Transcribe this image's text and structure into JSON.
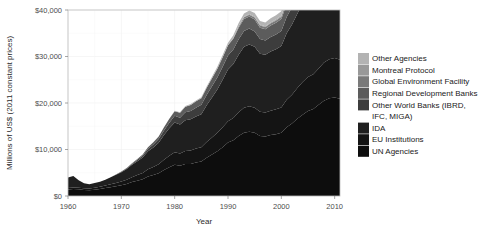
{
  "chart_data": {
    "type": "area",
    "stacked": true,
    "title": "",
    "xlabel": "Year",
    "ylabel": "Millions of US$ (2011 constant prices)",
    "xlim": [
      1960,
      2011
    ],
    "ylim": [
      0,
      40000
    ],
    "xticks": [
      1960,
      1970,
      1980,
      1990,
      2000,
      2010
    ],
    "xtick_labels": [
      "1960",
      "1970",
      "1980",
      "1990",
      "2000",
      "2010"
    ],
    "yticks": [
      0,
      10000,
      20000,
      30000,
      40000
    ],
    "ytick_labels": [
      "$0",
      "$10,000",
      "$20,000",
      "$30,000",
      "$40,000"
    ],
    "grid": true,
    "legend_position": "right",
    "x": [
      1960,
      1961,
      1962,
      1963,
      1964,
      1965,
      1966,
      1967,
      1968,
      1969,
      1970,
      1971,
      1972,
      1973,
      1974,
      1975,
      1976,
      1977,
      1978,
      1979,
      1980,
      1981,
      1982,
      1983,
      1984,
      1985,
      1986,
      1987,
      1988,
      1989,
      1990,
      1991,
      1992,
      1993,
      1994,
      1995,
      1996,
      1997,
      1998,
      1999,
      2000,
      2001,
      2002,
      2003,
      2004,
      2005,
      2006,
      2007,
      2008,
      2009,
      2010,
      2011
    ],
    "series": [
      {
        "name": "UN Agencies",
        "color": "#0d0d0d",
        "values": [
          1400,
          1500,
          1450,
          1300,
          1250,
          1350,
          1500,
          1700,
          1900,
          2100,
          2300,
          2600,
          3000,
          3300,
          3600,
          4200,
          4500,
          4900,
          5600,
          6200,
          6700,
          6500,
          6900,
          6900,
          7200,
          7400,
          8200,
          8900,
          9600,
          10500,
          11500,
          12000,
          12900,
          13600,
          13800,
          13600,
          12900,
          12800,
          13100,
          13300,
          13600,
          14800,
          15600,
          16600,
          17500,
          18300,
          18700,
          19600,
          20500,
          21000,
          21200,
          20900
        ]
      },
      {
        "name": "EU Institutions",
        "color": "#141414",
        "values": [
          300,
          320,
          340,
          360,
          380,
          420,
          480,
          540,
          620,
          700,
          800,
          900,
          1050,
          1200,
          1350,
          1550,
          1750,
          1950,
          2200,
          2450,
          2700,
          2650,
          2800,
          2900,
          3000,
          3100,
          3400,
          3700,
          4000,
          4300,
          4600,
          4800,
          5100,
          5400,
          5500,
          5400,
          5200,
          5150,
          5250,
          5350,
          5450,
          5900,
          6200,
          6600,
          7000,
          7300,
          7500,
          7800,
          8200,
          8400,
          8500,
          8400
        ]
      },
      {
        "name": "IDA",
        "color": "#1f1f1f",
        "values": [
          2300,
          2500,
          1600,
          1100,
          900,
          1000,
          1100,
          1250,
          1500,
          1750,
          2000,
          2300,
          2650,
          3000,
          3350,
          3900,
          4200,
          4600,
          5300,
          5900,
          6400,
          6200,
          6600,
          6700,
          6900,
          7100,
          7900,
          8600,
          9300,
          10200,
          11100,
          11600,
          12400,
          13100,
          13300,
          13100,
          12500,
          12400,
          12700,
          12900,
          13200,
          14300,
          15100,
          16000,
          16900,
          17700,
          18100,
          19000,
          19800,
          20300,
          20500,
          20200
        ]
      },
      {
        "name": "Other World Banks (IBRD, IFC, MIGA)",
        "color": "#3d3d3d",
        "values": [
          0,
          0,
          0,
          0,
          0,
          0,
          0,
          0,
          0,
          50,
          100,
          150,
          200,
          280,
          350,
          500,
          650,
          800,
          1000,
          1200,
          1450,
          1500,
          1700,
          1800,
          1900,
          2000,
          2200,
          2400,
          2600,
          2800,
          3000,
          3100,
          3300,
          3400,
          3400,
          3300,
          3150,
          3100,
          3150,
          3200,
          3250,
          3500,
          3700,
          3900,
          4100,
          4300,
          4400,
          4600,
          4800,
          4900,
          5000,
          4900
        ]
      },
      {
        "name": "Regional Development Banks",
        "color": "#5c5c5c",
        "values": [
          0,
          0,
          0,
          0,
          0,
          0,
          0,
          0,
          0,
          0,
          50,
          80,
          120,
          180,
          250,
          350,
          450,
          560,
          700,
          850,
          1000,
          1050,
          1200,
          1280,
          1350,
          1420,
          1580,
          1720,
          1870,
          2040,
          2220,
          2310,
          2470,
          2590,
          2620,
          2570,
          2440,
          2410,
          2460,
          2500,
          2540,
          2760,
          2910,
          3090,
          3250,
          3400,
          3480,
          3650,
          3810,
          3900,
          3950,
          3880
        ]
      },
      {
        "name": "Global Environment Facility",
        "color": "#7a7a7a",
        "values": [
          0,
          0,
          0,
          0,
          0,
          0,
          0,
          0,
          0,
          0,
          0,
          0,
          0,
          0,
          0,
          0,
          0,
          0,
          0,
          0,
          0,
          0,
          0,
          0,
          0,
          0,
          0,
          0,
          0,
          0,
          0,
          120,
          260,
          330,
          380,
          420,
          460,
          470,
          490,
          500,
          520,
          580,
          620,
          660,
          700,
          740,
          760,
          800,
          840,
          870,
          890,
          870
        ]
      },
      {
        "name": "Montreal Protocol",
        "color": "#999999",
        "values": [
          0,
          0,
          0,
          0,
          0,
          0,
          0,
          0,
          0,
          0,
          0,
          0,
          0,
          0,
          0,
          0,
          0,
          0,
          0,
          0,
          0,
          0,
          0,
          0,
          0,
          0,
          0,
          0,
          0,
          0,
          0,
          40,
          90,
          120,
          140,
          160,
          170,
          175,
          180,
          185,
          190,
          210,
          225,
          240,
          255,
          270,
          280,
          295,
          310,
          320,
          325,
          320
        ]
      },
      {
        "name": "Other Agencies",
        "color": "#b3b3b3",
        "values": [
          0,
          0,
          0,
          0,
          0,
          0,
          0,
          0,
          0,
          0,
          0,
          0,
          0,
          0,
          0,
          0,
          0,
          0,
          0,
          0,
          100,
          120,
          150,
          180,
          210,
          240,
          290,
          340,
          400,
          470,
          540,
          580,
          660,
          720,
          750,
          780,
          800,
          830,
          880,
          930,
          990,
          1150,
          1280,
          1450,
          1650,
          1900,
          2100,
          2400,
          2700,
          2950,
          3100,
          3050
        ]
      }
    ],
    "legend_entries": [
      {
        "label": "Other Agencies",
        "color": "#b3b3b3"
      },
      {
        "label": "Montreal Protocol",
        "color": "#999999"
      },
      {
        "label": "Global Environment Facility",
        "color": "#7a7a7a"
      },
      {
        "label": "Regional Development Banks",
        "color": "#5c5c5c"
      },
      {
        "label": "Other World Banks (IBRD,",
        "label2": "IFC, MIGA)",
        "color": "#3d3d3d"
      },
      {
        "label": "IDA",
        "color": "#1f1f1f"
      },
      {
        "label": "EU Institutions",
        "color": "#141414"
      },
      {
        "label": "UN Agencies",
        "color": "#0d0d0d"
      }
    ]
  }
}
